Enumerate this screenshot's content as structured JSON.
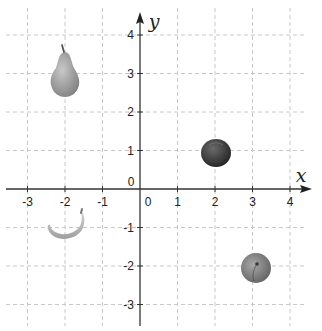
{
  "chart_data": {
    "type": "scatter",
    "title": "",
    "xlabel": "x",
    "ylabel": "y",
    "xlim": [
      -3.5,
      4.5
    ],
    "ylim": [
      -3.5,
      4.5
    ],
    "grid": true,
    "grid_style": "dashed",
    "x_ticks": [
      -3,
      -2,
      -1,
      0,
      1,
      2,
      3,
      4
    ],
    "y_ticks": [
      -3,
      -2,
      -1,
      0,
      1,
      2,
      3,
      4
    ],
    "x_tick_labels": [
      "-3",
      "-2",
      "-1",
      "0",
      "1",
      "2",
      "3",
      "4"
    ],
    "y_tick_labels": [
      "-3",
      "-2",
      "-1",
      "0",
      "1",
      "2",
      "3",
      "4"
    ],
    "points": [
      {
        "label": "pear",
        "x": -2,
        "y": 3
      },
      {
        "label": "apple",
        "x": 2,
        "y": 1
      },
      {
        "label": "banana",
        "x": -2,
        "y": -1
      },
      {
        "label": "peach",
        "x": 3,
        "y": -2
      }
    ]
  },
  "axes": {
    "x_name": "x",
    "y_name": "y",
    "origin_label_x": "0",
    "origin_label_y": "0"
  },
  "colors": {
    "axis": "#333333",
    "grid": "#c8c8c8",
    "pear": "#9a9a9a",
    "apple": "#3a3a3a",
    "banana": "#b5b5b5",
    "peach": "#7d7d7d"
  }
}
